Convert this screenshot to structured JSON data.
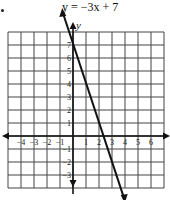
{
  "chart_data": {
    "type": "line",
    "title": "y = −3x + 7",
    "xlabel": "x",
    "ylabel": "y",
    "xlim": [
      -5,
      7
    ],
    "ylim": [
      -4,
      8
    ],
    "grid": true,
    "x_ticks": [
      -4,
      -3,
      -2,
      -1,
      1,
      2,
      3,
      4,
      5,
      6
    ],
    "y_ticks": [
      7,
      6,
      5,
      4,
      3,
      2,
      1,
      -1,
      -2,
      -3
    ],
    "series": [
      {
        "name": "y = -3x + 7",
        "slope": -3,
        "intercept": 7,
        "x": [
          -0.3,
          3.9
        ],
        "y": [
          7.9,
          -4.7
        ]
      }
    ]
  },
  "labels": {
    "title": "y = −3x + 7",
    "y_axis": "y",
    "x_axis": "x"
  }
}
